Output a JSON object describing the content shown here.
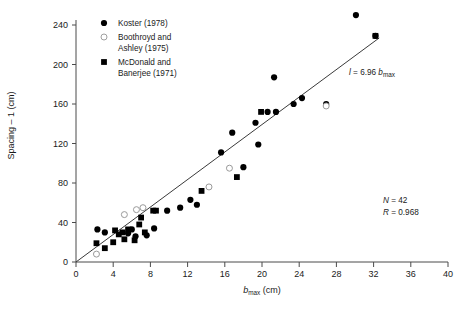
{
  "chart_data": {
    "type": "scatter",
    "title": "",
    "xlabel": "b_max (cm)",
    "xlabel_main": "b",
    "xlabel_sub": "max",
    "xlabel_unit": " (cm)",
    "ylabel": "Spacing – 1 (cm)",
    "xlim": [
      0,
      40
    ],
    "ylim": [
      0,
      250
    ],
    "xticks": [
      0,
      4,
      8,
      12,
      16,
      20,
      24,
      28,
      32,
      36,
      40
    ],
    "yticks": [
      0,
      40,
      80,
      120,
      160,
      200,
      240
    ],
    "grid": false,
    "legend_position": "top-left",
    "series": [
      {
        "name": "Koster (1978)",
        "marker": "filled-circle",
        "color": "#000000",
        "points": [
          [
            2.3,
            33
          ],
          [
            3.1,
            30
          ],
          [
            5.6,
            29
          ],
          [
            6.0,
            33
          ],
          [
            6.4,
            26
          ],
          [
            7.6,
            27
          ],
          [
            8.4,
            34
          ],
          [
            12.3,
            63
          ],
          [
            13.0,
            58
          ],
          [
            15.6,
            111
          ],
          [
            16.8,
            131
          ],
          [
            18.0,
            96
          ],
          [
            19.3,
            141
          ],
          [
            19.6,
            119
          ],
          [
            20.6,
            152
          ],
          [
            21.3,
            187
          ],
          [
            21.5,
            152
          ],
          [
            23.4,
            160
          ],
          [
            24.3,
            166
          ],
          [
            26.9,
            160
          ],
          [
            30.1,
            250
          ],
          [
            32.2,
            229
          ],
          [
            11.2,
            55
          ],
          [
            9.8,
            52
          ]
        ]
      },
      {
        "name": "Boothroyd and Ashley (1975)",
        "marker": "open-circle",
        "color": "#9a9a9a",
        "points": [
          [
            2.2,
            8
          ],
          [
            5.2,
            48
          ],
          [
            6.5,
            53
          ],
          [
            7.2,
            55
          ],
          [
            14.3,
            76
          ],
          [
            16.5,
            95
          ],
          [
            26.9,
            158
          ]
        ]
      },
      {
        "name": "McDonald and Banerjee (1971)",
        "marker": "filled-square",
        "color": "#000000",
        "points": [
          [
            2.2,
            19
          ],
          [
            3.1,
            14
          ],
          [
            4.2,
            32
          ],
          [
            4.6,
            28
          ],
          [
            5.0,
            30
          ],
          [
            5.2,
            23
          ],
          [
            5.6,
            33
          ],
          [
            6.3,
            22
          ],
          [
            7.0,
            45
          ],
          [
            7.4,
            30
          ],
          [
            8.3,
            52
          ],
          [
            8.6,
            52
          ],
          [
            13.5,
            72
          ],
          [
            17.3,
            86
          ],
          [
            19.9,
            152
          ],
          [
            32.2,
            229
          ],
          [
            4.0,
            20
          ],
          [
            6.8,
            38
          ]
        ]
      }
    ],
    "fit_line": {
      "equation_main": "l",
      "equation_rest": " = 6.96 ",
      "equation_var": "b",
      "equation_sub": "max",
      "slope": 6.96,
      "intercept": 0,
      "x_start": 0,
      "x_end": 32.6
    },
    "annotations": {
      "n_label": "N",
      "n_value": " = 42",
      "r_label": "R",
      "r_value": " = 0.968"
    }
  },
  "legend": {
    "items": [
      {
        "label": "Koster (1978)",
        "marker": "filled-circle"
      },
      {
        "label": "Boothroyd and",
        "label2": "Ashley (1975)",
        "marker": "open-circle"
      },
      {
        "label": "McDonald and",
        "label2": "Banerjee (1971)",
        "marker": "filled-square"
      }
    ]
  },
  "ticks": {
    "x": [
      "0",
      "4",
      "8",
      "12",
      "16",
      "20",
      "24",
      "28",
      "32",
      "36",
      "40"
    ],
    "y": [
      "0",
      "40",
      "80",
      "120",
      "160",
      "200",
      "240"
    ]
  },
  "colors": {
    "axis": "#4a4a4a",
    "marker_filled": "#000000",
    "marker_open": "#a0a0a0",
    "text": "#1a1a1a",
    "fit_line": "#3a3a3a"
  }
}
